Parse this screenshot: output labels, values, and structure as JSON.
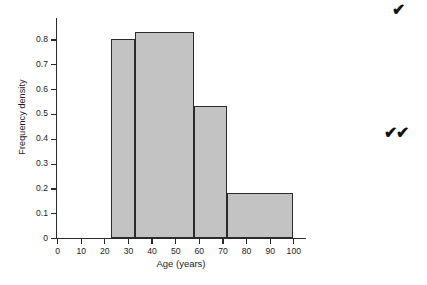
{
  "chart_data": {
    "type": "bar",
    "title": "",
    "subtitle": "",
    "xlabel": "Age (years)",
    "ylabel": "Frequency density",
    "xlim": [
      0,
      105
    ],
    "ylim": [
      0,
      0.87
    ],
    "grid": false,
    "legend": null,
    "x_ticks": [
      0,
      10,
      20,
      30,
      40,
      50,
      60,
      70,
      80,
      90,
      100
    ],
    "x_tick_labels": [
      "0",
      "10",
      "20",
      "30",
      "40",
      "50",
      "60",
      "70",
      "80",
      "90",
      "100"
    ],
    "y_ticks": [
      0,
      0.1,
      0.2,
      0.3,
      0.4,
      0.5,
      0.6,
      0.7,
      0.8
    ],
    "y_tick_labels": [
      "0",
      "0.1",
      "0.2",
      "0.3",
      "0.4",
      "0.5",
      "0.6",
      "0.7",
      "0.8"
    ],
    "bin_edges": [
      23,
      33,
      58,
      72,
      100
    ],
    "values": [
      0.8,
      0.83,
      0.53,
      0.18
    ],
    "bars": [
      {
        "name": "bin-23-33",
        "x0": 23,
        "x1": 33,
        "value": 0.8
      },
      {
        "name": "bin-33-58",
        "x0": 33,
        "x1": 58,
        "value": 0.83
      },
      {
        "name": "bin-58-72",
        "x0": 58,
        "x1": 72,
        "value": 0.53
      },
      {
        "name": "bin-72-100",
        "x0": 72,
        "x1": 100,
        "value": 0.18
      }
    ],
    "bar_fill_color": "#c3c3c3",
    "bar_edge_color": "#2b2b2b",
    "axis_color": "#2b2b2b",
    "background_color": "#ffffff"
  },
  "annotations": {
    "single_check": "✔",
    "double_check": "✔✔"
  }
}
